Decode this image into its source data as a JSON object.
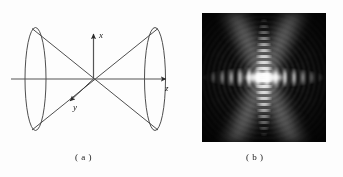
{
  "figure": {
    "background_color": "#fdfdfd",
    "width": 343,
    "height": 177
  },
  "panel_a": {
    "id": "a",
    "caption": "( a )",
    "description": "double-cone (bicone) diagram with cartesian axes",
    "line_color": "#333333",
    "axes": [
      {
        "name": "x",
        "label": "x",
        "direction": "up",
        "arrow": true
      },
      {
        "name": "y",
        "label": "y",
        "direction": "down-left",
        "arrow": true
      },
      {
        "name": "z",
        "label": "z",
        "direction": "right",
        "arrow": true
      }
    ],
    "shapes": [
      {
        "name": "left-cone-ellipse",
        "type": "ellipse"
      },
      {
        "name": "right-cone-ellipse",
        "type": "ellipse"
      },
      {
        "name": "cone-generatrix-lines",
        "type": "lines",
        "count": 4
      }
    ]
  },
  "panel_b": {
    "id": "b",
    "caption": "( b )",
    "description": "grayscale far-field diffraction intensity pattern",
    "background_color": "#050505",
    "core_color": "#ffffff",
    "features": [
      {
        "name": "central-lobe",
        "shape": "horizontal-ellipse",
        "brightness": "saturated-white"
      },
      {
        "name": "horizontal-fringes",
        "shape": "row-of-side-lobes",
        "brightness": "medium"
      },
      {
        "name": "vertical-streak",
        "shape": "column-of-fringes",
        "brightness": "medium"
      },
      {
        "name": "diagonal-lobes",
        "shape": "x-cross",
        "brightness": "low-medium"
      },
      {
        "name": "concentric-rings",
        "shape": "ring-texture",
        "brightness": "low"
      }
    ]
  }
}
